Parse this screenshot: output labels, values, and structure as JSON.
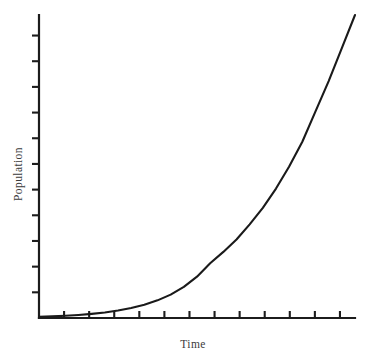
{
  "chart_data": {
    "type": "line",
    "title": "",
    "subtitle": "",
    "xlabel": "Time",
    "ylabel": "Population",
    "grid": false,
    "legend": false,
    "legend_position": "none",
    "annotations": [],
    "xtick_labels": [],
    "ytick_labels": [],
    "xlim": [
      0,
      12
    ],
    "ylim": [
      0,
      11
    ],
    "x_tick_count": 12,
    "y_tick_count": 11,
    "curve_color": "#1a1a1a",
    "axis_color": "#1c1c1c",
    "background_color": "#ffffff",
    "series": [
      {
        "name": "Population",
        "x": [
          0,
          0.5,
          1,
          1.5,
          2,
          2.5,
          3,
          3.5,
          4,
          4.5,
          5,
          5.5,
          6,
          6.5,
          7,
          7.5,
          8,
          8.5,
          9,
          9.5,
          10,
          10.5,
          11,
          11.5,
          12
        ],
        "y": [
          0.04,
          0.06,
          0.08,
          0.11,
          0.15,
          0.2,
          0.27,
          0.36,
          0.48,
          0.64,
          0.85,
          1.13,
          1.5,
          1.99,
          2.4,
          2.85,
          3.4,
          4.0,
          4.7,
          5.5,
          6.4,
          7.5,
          8.6,
          9.8,
          11.0
        ]
      }
    ]
  },
  "axis_titles": {
    "x": "Time",
    "y": "Population"
  }
}
